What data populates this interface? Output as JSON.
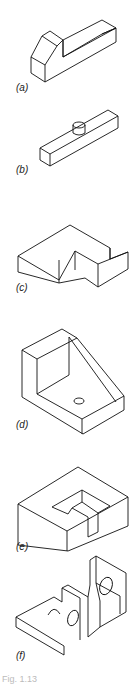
{
  "figures": [
    {
      "id": "a",
      "label": "(a)"
    },
    {
      "id": "b",
      "label": "(b)"
    },
    {
      "id": "c",
      "label": "(c)"
    },
    {
      "id": "d",
      "label": "(d)"
    },
    {
      "id": "e",
      "label": "(e)"
    },
    {
      "id": "f",
      "label": "(f)"
    }
  ],
  "caption": "Fig. 1.13",
  "colors": {
    "stroke": "#111111",
    "background": "#ffffff"
  }
}
